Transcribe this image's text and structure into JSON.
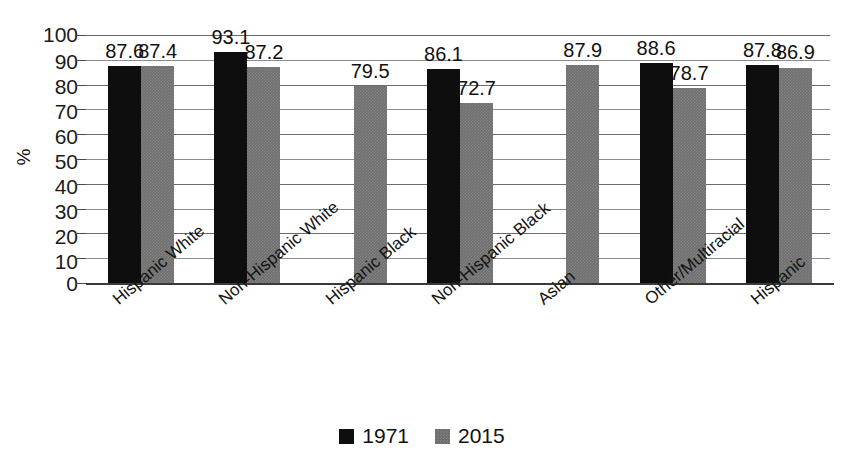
{
  "chart_data": {
    "type": "bar",
    "title": "",
    "subtitle": "",
    "xlabel": "",
    "ylabel": "%",
    "ylim": [
      0,
      100
    ],
    "ytick_step": 10,
    "yticks": [
      "100",
      "90",
      "80",
      "70",
      "60",
      "50",
      "40",
      "30",
      "20",
      "10",
      "0"
    ],
    "grid": true,
    "legend_position": "bottom-center",
    "categories": [
      "Hispanic White",
      "Non-Hispanic White",
      "Hispanic Black",
      "Non-Hispanic Black",
      "Asian",
      "Other/Multiracial",
      "Hispanic"
    ],
    "series": [
      {
        "name": "1971",
        "color": "#0e0e0e",
        "values": [
          87.6,
          93.1,
          null,
          86.1,
          null,
          88.6,
          87.8
        ],
        "labels": [
          "87.6",
          "93.1",
          "",
          "86.1",
          "",
          "88.6",
          "87.8"
        ]
      },
      {
        "name": "2015",
        "color": "#6f6f6f",
        "values": [
          87.4,
          87.2,
          79.5,
          72.7,
          87.9,
          78.7,
          86.9
        ],
        "labels": [
          "87.4",
          "87.2",
          "79.5",
          "72.7",
          "87.9",
          "78.7",
          "86.9"
        ]
      }
    ]
  },
  "legend": {
    "items": [
      {
        "label": "1971",
        "swatch": "black-square-icon"
      },
      {
        "label": "2015",
        "swatch": "gray-square-icon"
      }
    ]
  }
}
